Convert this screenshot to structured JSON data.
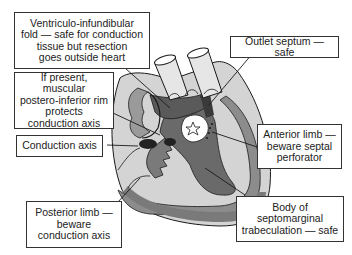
{
  "diagram": {
    "center_marker": "star",
    "colors": {
      "background": "#ffffff",
      "box_border": "#333333",
      "text": "#222222",
      "heart_light": "#d4d4d4",
      "heart_mid": "#8c8c8c",
      "heart_dark": "#5a5a5a",
      "conduction_axis": "#222222",
      "outline": "#1a1a1a"
    },
    "labels": [
      {
        "id": "ventriculo-infundibular-fold",
        "text": "Ventriculo-infundibular\nfold — safe for conduction\ntissue but resection\ngoes outside heart"
      },
      {
        "id": "postero-inferior-rim",
        "text": "If present, muscular\npostero-inferior rim\nprotects\nconduction axis"
      },
      {
        "id": "conduction-axis",
        "text": "Conduction axis"
      },
      {
        "id": "posterior-limb",
        "text": "Posterior limb —\nbeware\nconduction axis"
      },
      {
        "id": "outlet-septum",
        "text": "Outlet septum — safe"
      },
      {
        "id": "anterior-limb",
        "text": "Anterior limb —\nbeware septal\nperforator"
      },
      {
        "id": "septomarginal-body",
        "text": "Body of\nseptomarginal\ntrabeculation — safe"
      }
    ]
  }
}
